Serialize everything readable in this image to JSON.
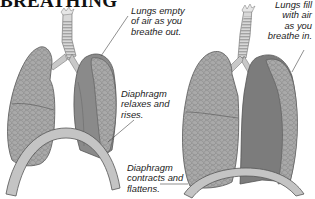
{
  "title": "BREATHING",
  "figures": [
    {
      "id": "exhale",
      "description": "Lungs deflated, diaphragm domed upward",
      "labels": [
        {
          "name": "lungs-empty",
          "lines": [
            "Lungs empty",
            "of air as you",
            "breathe out."
          ]
        },
        {
          "name": "diaphragm-relaxes",
          "lines": [
            "Diaphragm",
            "relaxes and",
            "rises."
          ]
        }
      ]
    },
    {
      "id": "inhale",
      "description": "Lungs inflated, diaphragm flattened",
      "labels": [
        {
          "name": "lungs-fill",
          "lines": [
            "Lungs fill",
            "with air",
            "as you",
            "breathe in."
          ]
        },
        {
          "name": "diaphragm-contracts",
          "lines": [
            "Diaphragm",
            "contracts and",
            "flattens."
          ]
        }
      ]
    }
  ],
  "colors": {
    "lung": "#a9a9a9",
    "lung_dark": "#8a8a8a",
    "lung_inner": "#7c7c7c",
    "diaphragm": "#c4c4c4",
    "trachea": "#d8d8d8",
    "outline": "#555555",
    "text": "#222222"
  }
}
